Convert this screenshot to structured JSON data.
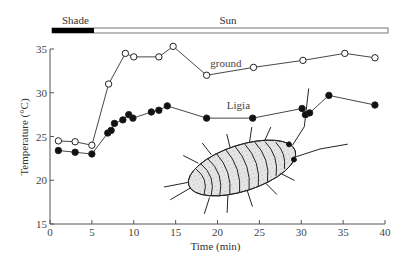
{
  "chart_data": {
    "type": "line",
    "title": "",
    "xlabel": "Time (min)",
    "ylabel": "Temperature (°C)",
    "xlim": [
      0,
      40
    ],
    "ylim": [
      15,
      35
    ],
    "x_ticks": [
      0,
      5,
      10,
      15,
      20,
      25,
      30,
      35,
      40
    ],
    "y_ticks": [
      15,
      20,
      25,
      30,
      35
    ],
    "grid": false,
    "legend": "inline labels",
    "condition_bar": {
      "segments": [
        {
          "label": "Shade",
          "start": 0,
          "end": 5,
          "fill": "#000000"
        },
        {
          "label": "Sun",
          "start": 5,
          "end": 40,
          "fill": "#ffffff"
        }
      ]
    },
    "series": [
      {
        "name": "ground",
        "marker": "open-circle",
        "x": [
          1,
          3,
          5,
          7,
          9,
          10,
          13,
          14.7,
          18.7,
          24.3,
          30.2,
          35.2,
          38.8
        ],
        "values": [
          24.5,
          24.4,
          24.0,
          31.0,
          34.5,
          34.1,
          34.1,
          35.3,
          32.0,
          32.9,
          33.7,
          34.5,
          34.0
        ],
        "label_pos": [
          21,
          33
        ]
      },
      {
        "name": "Ligia",
        "marker": "filled-circle",
        "x": [
          1,
          3,
          5,
          6.9,
          7.3,
          7.7,
          8.7,
          9.4,
          9.9,
          12.1,
          13,
          14,
          18.7,
          24.2,
          30.1,
          30.5,
          31,
          33.3,
          38.8
        ],
        "values": [
          23.4,
          23.2,
          23.0,
          25.4,
          25.7,
          26.5,
          26.9,
          27.5,
          27.1,
          27.8,
          28.0,
          28.5,
          27.1,
          27.1,
          28.2,
          27.5,
          27.7,
          29.7,
          28.6
        ],
        "label_pos": [
          22.5,
          28.2
        ]
      }
    ],
    "annotations": [
      "Illustration of Ligia (sea slater isopod)"
    ]
  }
}
